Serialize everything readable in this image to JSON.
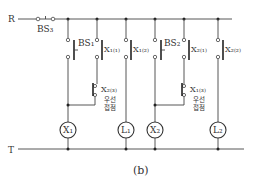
{
  "diagram": {
    "type": "relay-ladder-interlock-circuit",
    "caption": "(b)",
    "rails": {
      "top": "R",
      "bottom": "T"
    },
    "main_switch": "BS₃",
    "branches": [
      {
        "id": "x1-branch",
        "switch": "BS₁",
        "self_hold": "X₁₍₁₎",
        "interlock": "X₂₍₃₎",
        "interlock_note_line1": "우선",
        "interlock_note_line2": "접점",
        "coil": "X₁"
      },
      {
        "id": "l1-branch",
        "contact": "X₁₍₂₎",
        "lamp": "L₁"
      },
      {
        "id": "x2-branch",
        "switch": "BS₂",
        "self_hold": "X₂₍₁₎",
        "interlock": "X₁₍₃₎",
        "interlock_note_line1": "우선",
        "interlock_note_line2": "접점",
        "coil": "X₂"
      },
      {
        "id": "l2-branch",
        "contact": "X₂₍₂₎",
        "lamp": "L₂"
      }
    ]
  }
}
